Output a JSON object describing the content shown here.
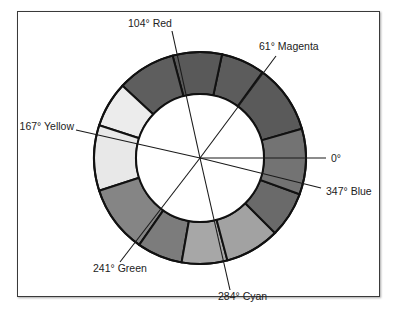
{
  "diagram": {
    "type": "hue-color-wheel",
    "center": [
      200,
      158
    ],
    "outer_radius": 106,
    "inner_radius": 64,
    "segments": [
      {
        "start": 16,
        "end": 54,
        "fill": "#5a5a5a"
      },
      {
        "start": 54,
        "end": 78,
        "fill": "#5c5c5c"
      },
      {
        "start": 78,
        "end": 105,
        "fill": "#595959"
      },
      {
        "start": 105,
        "end": 137,
        "fill": "#5e5e5e"
      },
      {
        "start": 137,
        "end": 162,
        "fill": "#ececec"
      },
      {
        "start": 162,
        "end": 198,
        "fill": "#e8e8e8"
      },
      {
        "start": 198,
        "end": 235,
        "fill": "#858585"
      },
      {
        "start": 235,
        "end": 260,
        "fill": "#7c7c7c"
      },
      {
        "start": 260,
        "end": 285,
        "fill": "#a7a7a7"
      },
      {
        "start": 285,
        "end": 315,
        "fill": "#a2a2a2"
      },
      {
        "start": 315,
        "end": 340,
        "fill": "#6a6a6a"
      },
      {
        "start": 340,
        "end": 376,
        "fill": "#737373"
      }
    ],
    "axes": [
      {
        "name": "red",
        "angle": 104,
        "label": "104°  Red",
        "label_x": 128,
        "label_y": 27,
        "anchor": "start",
        "end_x": 172,
        "end_y": 31
      },
      {
        "name": "magenta",
        "angle": 61,
        "label": "61° Magenta",
        "label_x": 259,
        "label_y": 50,
        "anchor": "start",
        "end_x": 276,
        "end_y": 56
      },
      {
        "name": "yellow",
        "angle": 167,
        "label": "167° Yellow",
        "label_x": 74,
        "label_y": 130,
        "anchor": "end",
        "end_x": 76,
        "end_y": 130
      },
      {
        "name": "zero",
        "angle": 0,
        "label": "0°",
        "label_x": 331,
        "label_y": 162,
        "anchor": "start",
        "end_x": 326,
        "end_y": 158
      },
      {
        "name": "blue",
        "angle": 347,
        "label": "347° Blue",
        "label_x": 326,
        "label_y": 195,
        "anchor": "start",
        "end_x": 321,
        "end_y": 188
      },
      {
        "name": "green",
        "angle": 241,
        "label": "241° Green",
        "label_x": 93,
        "label_y": 272,
        "anchor": "start",
        "end_x": 120,
        "end_y": 262
      },
      {
        "name": "cyan",
        "angle": 284,
        "label": "284° Cyan",
        "label_x": 218,
        "label_y": 300,
        "anchor": "start",
        "end_x": 230,
        "end_y": 290
      }
    ]
  }
}
